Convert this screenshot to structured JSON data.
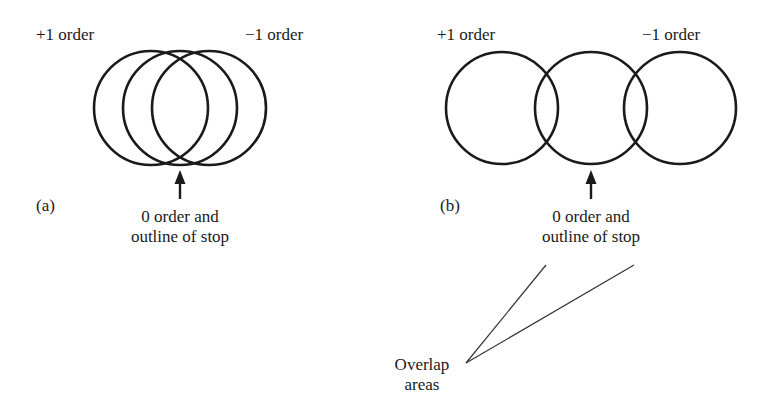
{
  "panel_a": {
    "label": "(a)",
    "plus_order": "+1 order",
    "minus_order": "−1 order",
    "zero_order_line1": "0 order and",
    "zero_order_line2": "outline of stop",
    "circles": [
      {
        "role": "+1 order",
        "cx": 151,
        "cy": 108,
        "r": 57
      },
      {
        "role": "0 order",
        "cx": 180,
        "cy": 108,
        "r": 57
      },
      {
        "role": "-1 order",
        "cx": 209,
        "cy": 108,
        "r": 57
      }
    ]
  },
  "panel_b": {
    "label": "(b)",
    "plus_order": "+1 order",
    "minus_order": "−1 order",
    "zero_order_line1": "0 order and",
    "zero_order_line2": "outline of stop",
    "overlap_line1": "Overlap",
    "overlap_line2": "areas",
    "circles": [
      {
        "role": "+1 order",
        "cx": 502,
        "cy": 108,
        "r": 56
      },
      {
        "role": "0 order",
        "cx": 591,
        "cy": 108,
        "r": 56
      },
      {
        "role": "-1 order",
        "cx": 680,
        "cy": 108,
        "r": 56
      }
    ]
  }
}
